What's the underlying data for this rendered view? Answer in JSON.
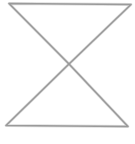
{
  "figure": {
    "shape": "hourglass",
    "stroke_color": "#9a9a9a",
    "background_color": "#ffffff",
    "stroke_width": 1.6,
    "points": {
      "top_left": [
        9,
        3.5
      ],
      "top_right": [
        131,
        4.5
      ],
      "center": [
        69,
        64
      ],
      "bottom_left": [
        6,
        125.5
      ],
      "bottom_right": [
        128,
        126.5
      ]
    },
    "parts": [
      {
        "name": "upper-triangle",
        "vertices": [
          "top_left",
          "top_right",
          "center"
        ]
      },
      {
        "name": "lower-triangle",
        "vertices": [
          "center",
          "bottom_left",
          "bottom_right"
        ]
      }
    ]
  }
}
